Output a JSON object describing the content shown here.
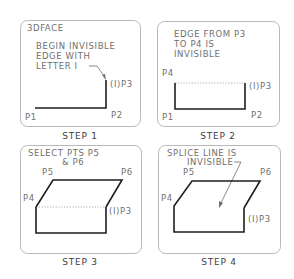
{
  "diagram": {
    "panels": [
      {
        "id": "step1",
        "header": "3DFACE",
        "note_lines": [
          "BEGIN INVISIBLE",
          "EDGE WITH",
          "LETTER I"
        ],
        "points": {
          "p1": "P1",
          "p2": "P2",
          "p3": "(I)P3"
        },
        "caption": "STEP 1"
      },
      {
        "id": "step2",
        "note_lines": [
          "EDGE FROM P3",
          "TO P4 IS",
          "INVISIBLE"
        ],
        "points": {
          "p1": "P1",
          "p2": "P2",
          "p3": "(I)P3",
          "p4": "P4"
        },
        "caption": "STEP 2"
      },
      {
        "id": "step3",
        "note_lines": [
          "SELECT PTS P5",
          "& P6"
        ],
        "points": {
          "p3": "(I)P3",
          "p4": "P4",
          "p5": "P5",
          "p6": "P6"
        },
        "caption": "STEP 3"
      },
      {
        "id": "step4",
        "note_lines": [
          "SPLICE LINE IS",
          "INVISIBLE"
        ],
        "points": {
          "p3": "(I)P3",
          "p4": "P4",
          "p5": "P5",
          "p6": "P6"
        },
        "caption": "STEP 4"
      }
    ]
  }
}
